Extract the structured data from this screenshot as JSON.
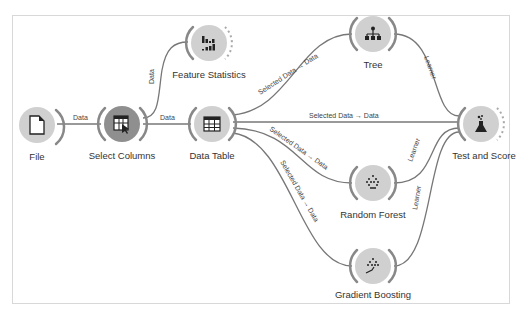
{
  "canvas": {
    "border_color": "#d8d8d8",
    "link_color": "#777777",
    "node_fill": "#d0d0d0"
  },
  "nodes": [
    {
      "id": "file",
      "label": "File",
      "icon": "file-icon"
    },
    {
      "id": "select_columns",
      "label": "Select Columns",
      "icon": "select-columns-icon"
    },
    {
      "id": "feature_statistics",
      "label": "Feature Statistics",
      "icon": "bar-chart-icon"
    },
    {
      "id": "data_table",
      "label": "Data Table",
      "icon": "table-icon"
    },
    {
      "id": "tree",
      "label": "Tree",
      "icon": "tree-icon"
    },
    {
      "id": "test_and_score",
      "label": "Test and Score",
      "icon": "flask-icon"
    },
    {
      "id": "random_forest",
      "label": "Random Forest",
      "icon": "forest-icon"
    },
    {
      "id": "gradient_boosting",
      "label": "Gradient Boosting",
      "icon": "gradient-boosting-icon"
    }
  ],
  "links": [
    {
      "from": "File",
      "to": "Select Columns",
      "label": "Data"
    },
    {
      "from": "Select Columns",
      "to": "Feature Statistics",
      "label": "Data"
    },
    {
      "from": "Select Columns",
      "to": "Data Table",
      "label": "Data"
    },
    {
      "from": "Data Table",
      "to": "Tree",
      "label": "Selected Data → Data"
    },
    {
      "from": "Data Table",
      "to": "Test and Score",
      "label": "Selected Data → Data"
    },
    {
      "from": "Data Table",
      "to": "Random Forest",
      "label": "Selected Data → Data"
    },
    {
      "from": "Data Table",
      "to": "Gradient Boosting",
      "label": "Selected Data → Data"
    },
    {
      "from": "Tree",
      "to": "Test and Score",
      "label": "Learner"
    },
    {
      "from": "Random Forest",
      "to": "Test and Score",
      "label": "Learner"
    },
    {
      "from": "Gradient Boosting",
      "to": "Test and Score",
      "label": "Learner"
    }
  ]
}
